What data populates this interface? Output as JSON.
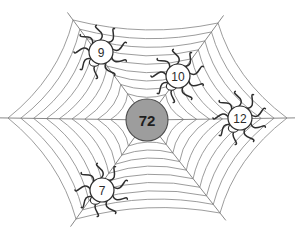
{
  "puzzle": {
    "type": "spider-web-number-puzzle",
    "center": {
      "value": "72",
      "fill_color": "#9d9d9d",
      "stroke_color": "#4a4a4a",
      "cx": 147,
      "cy": 120,
      "r": 21
    },
    "web": {
      "line_color": "#7a7a7a",
      "background": "#ffffff",
      "spoke_count": 6,
      "ring_count": 9,
      "vertices": [
        {
          "name": "top-left",
          "x": 73,
          "y": 20
        },
        {
          "name": "top-right",
          "x": 218,
          "y": 23
        },
        {
          "name": "right",
          "x": 287,
          "y": 118
        },
        {
          "name": "bottom-right",
          "x": 220,
          "y": 213
        },
        {
          "name": "bottom-left",
          "x": 76,
          "y": 219
        },
        {
          "name": "left",
          "x": 8,
          "y": 118
        }
      ]
    },
    "spiders": [
      {
        "name": "spider-nine",
        "value": "9",
        "cx": 101,
        "cy": 52,
        "r": 12,
        "leg_color": "#2e2e2e",
        "body_fill": "#ffffff"
      },
      {
        "name": "spider-ten",
        "value": "10",
        "cx": 178,
        "cy": 76,
        "r": 12,
        "leg_color": "#2e2e2e",
        "body_fill": "#ffffff"
      },
      {
        "name": "spider-twelve",
        "value": "12",
        "cx": 240,
        "cy": 118,
        "r": 12,
        "leg_color": "#2e2e2e",
        "body_fill": "#ffffff"
      },
      {
        "name": "spider-seven",
        "value": "7",
        "cx": 102,
        "cy": 190,
        "r": 12,
        "leg_color": "#2e2e2e",
        "body_fill": "#ffffff"
      }
    ]
  }
}
